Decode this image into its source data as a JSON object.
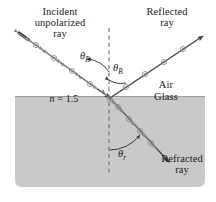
{
  "figure": {
    "background_color": "#ffffff",
    "glass_color": "#c9c9c9",
    "line_color": "#4a4a4a",
    "text_color": "#1a1a1a"
  },
  "labels": {
    "incident_ray": "Incident\nunpolarized\nray",
    "incident_ray_line1": "Incident",
    "incident_ray_line2": "unpolarized",
    "incident_ray_line3": "ray",
    "reflected_ray_line1": "Reflected",
    "reflected_ray_line2": "ray",
    "refracted_ray_line1": "Refracted",
    "refracted_ray_line2": "ray",
    "air": "Air",
    "glass": "Glass",
    "refractive_index_symbol": "n",
    "refractive_index_equals": " = ",
    "refractive_index_value": "1.5",
    "theta_brewster_symbol": "θ",
    "theta_brewster_subscript": "B",
    "theta_refraction_symbol": "θ",
    "theta_refraction_subscript": "r"
  },
  "geometry": {
    "incidence_point_x": 110,
    "incidence_point_y": 98,
    "normal_x": 109,
    "normal_top_y": 28,
    "normal_bottom_y": 176,
    "interface_y": 98,
    "glass_left": 15,
    "glass_right": 205,
    "glass_top": 96,
    "glass_bottom": 187,
    "incident_start_x": 19,
    "incident_start_y": 33,
    "reflected_end_x": 205,
    "reflected_end_y": 35,
    "refracted_end_x": 171,
    "refracted_end_y": 164
  },
  "rays": [
    {
      "name": "incident-ray",
      "label": "Incident unpolarized ray",
      "polarization": "unpolarized",
      "symbols": [
        "dot",
        "double-arrow"
      ]
    },
    {
      "name": "reflected-ray",
      "label": "Reflected ray",
      "polarization": "fully polarized perpendicular to plane of incidence",
      "symbols": [
        "dot"
      ]
    },
    {
      "name": "refracted-ray",
      "label": "Refracted ray",
      "polarization": "partially polarized",
      "symbols": [
        "dot",
        "double-arrow"
      ]
    }
  ],
  "angles": [
    {
      "name": "theta-b-incident",
      "symbol": "θ",
      "subscript": "B"
    },
    {
      "name": "theta-b-reflected",
      "symbol": "θ",
      "subscript": "B"
    },
    {
      "name": "theta-r-refracted",
      "symbol": "θ",
      "subscript": "r"
    }
  ]
}
